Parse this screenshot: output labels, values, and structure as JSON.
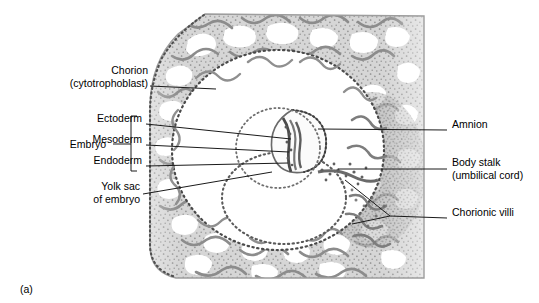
{
  "figure": {
    "letter": "(a)",
    "kind": "histological-section",
    "background_color": "#ffffff",
    "ink_color": "#000000"
  },
  "palette": {
    "tissue_light": "#e2e2e2",
    "tissue_mid": "#c9c9c9",
    "tissue_dark": "#9a9a9a",
    "nuclei": "#6d6d6d",
    "lacuna_white": "#ffffff",
    "membrane_dots": "#555555",
    "leader_line": "#1a1a1a"
  },
  "labels": [
    {
      "id": "chorion",
      "line1": "Chorion",
      "line2": "(cytotrophoblast)",
      "side": "left",
      "text_x": 138,
      "text_y": 70,
      "leader": [
        [
          150,
          86
        ],
        [
          216,
          89
        ]
      ]
    },
    {
      "id": "embryo-group",
      "line1": "Embryo",
      "line2": "",
      "side": "left",
      "text_x": 68,
      "text_y": 137,
      "leader": []
    },
    {
      "id": "ectoderm",
      "line1": "Ectoderm",
      "line2": "",
      "side": "left",
      "text_x": 142,
      "text_y": 118,
      "leader": [
        [
          146,
          124
        ],
        [
          291,
          139
        ]
      ]
    },
    {
      "id": "mesoderm",
      "line1": "Mesoderm",
      "line2": "",
      "side": "left",
      "text_x": 142,
      "text_y": 139,
      "leader": [
        [
          146,
          145
        ],
        [
          289,
          152
        ]
      ]
    },
    {
      "id": "endoderm",
      "line1": "Endoderm",
      "line2": "",
      "side": "left",
      "text_x": 142,
      "text_y": 160,
      "leader": [
        [
          146,
          166
        ],
        [
          288,
          163
        ]
      ]
    },
    {
      "id": "yolk-sac",
      "line1": "Yolk sac",
      "line2": "of embryo",
      "side": "left",
      "text_x": 138,
      "text_y": 186,
      "leader": [
        [
          143,
          194
        ],
        [
          272,
          172
        ]
      ]
    },
    {
      "id": "amnion",
      "line1": "Amnion",
      "line2": "",
      "side": "right",
      "text_x": 452,
      "text_y": 124,
      "leader": [
        [
          447,
          130
        ],
        [
          318,
          129
        ]
      ]
    },
    {
      "id": "body-stalk",
      "line1": "Body stalk",
      "line2": "(umbilical cord)",
      "side": "right",
      "text_x": 452,
      "text_y": 162,
      "leader": [
        [
          447,
          169
        ],
        [
          338,
          169
        ]
      ]
    },
    {
      "id": "chorionic-villi",
      "line1": "Chorionic villi",
      "line2": "",
      "side": "right",
      "text_x": 452,
      "text_y": 212,
      "leader": [
        [
          447,
          218
        ],
        [
          390,
          216
        ]
      ],
      "branches": [
        [
          [
            390,
            216
          ],
          [
            345,
            180
          ]
        ],
        [
          [
            390,
            216
          ],
          [
            352,
            224
          ]
        ]
      ]
    }
  ],
  "bracket": {
    "x": 131,
    "top": 116,
    "bottom": 171,
    "tick_len": 6,
    "stem_from_x": 113,
    "stem_y": 144
  },
  "anatomy": {
    "chorionic_cavity": {
      "cx": 278,
      "cy": 150,
      "rx": 106,
      "ry": 100
    },
    "amniotic_sac": {
      "cx": 292,
      "cy": 144,
      "rx": 40,
      "ry": 37
    },
    "yolk_sac": {
      "cx": 284,
      "cy": 198,
      "rx": 62,
      "ry": 46
    },
    "embryonic_disc": {
      "x": 292,
      "y": 150
    },
    "tissue_left_edge_x": 148,
    "tissue_right_edge_x": 424,
    "tissue_top_y": 14,
    "tissue_bottom_y": 279
  }
}
